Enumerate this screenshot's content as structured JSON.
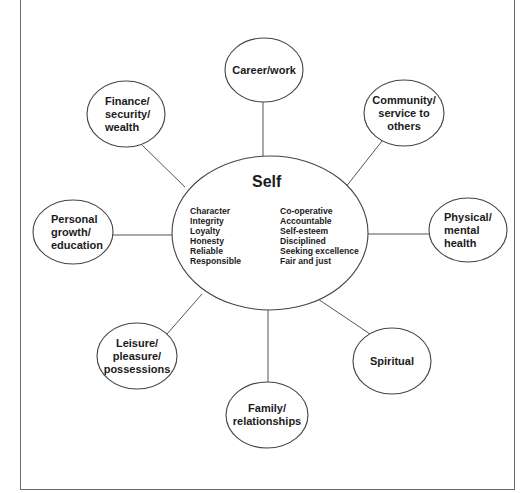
{
  "diagram": {
    "type": "mind-map",
    "colors": {
      "line": "#555555",
      "text": "#1b1b1b",
      "background": "#ffffff",
      "frame": "#6a6a6a"
    },
    "center": {
      "title": "Self",
      "traits_left": [
        "Character",
        "Integrity",
        "Loyalty",
        "Honesty",
        "Reliable",
        "Responsible"
      ],
      "traits_right": [
        "Co-operative",
        "Accountable",
        "Self-esteem",
        "Disciplined",
        "Seeking excellence",
        "Fair and just"
      ]
    },
    "nodes": [
      {
        "id": "career",
        "lines": [
          "Career/work"
        ]
      },
      {
        "id": "finance",
        "lines": [
          "Finance/",
          "security/",
          "wealth"
        ]
      },
      {
        "id": "community",
        "lines": [
          "Community/",
          "service to",
          "others"
        ]
      },
      {
        "id": "personal",
        "lines": [
          "Personal",
          "growth/",
          "education"
        ]
      },
      {
        "id": "physical",
        "lines": [
          "Physical/",
          "mental",
          "health"
        ]
      },
      {
        "id": "leisure",
        "lines": [
          "Leisure/",
          "pleasure/",
          "possessions"
        ]
      },
      {
        "id": "spiritual",
        "lines": [
          "Spiritual"
        ]
      },
      {
        "id": "family",
        "lines": [
          "Family/",
          "relationships"
        ]
      }
    ]
  }
}
